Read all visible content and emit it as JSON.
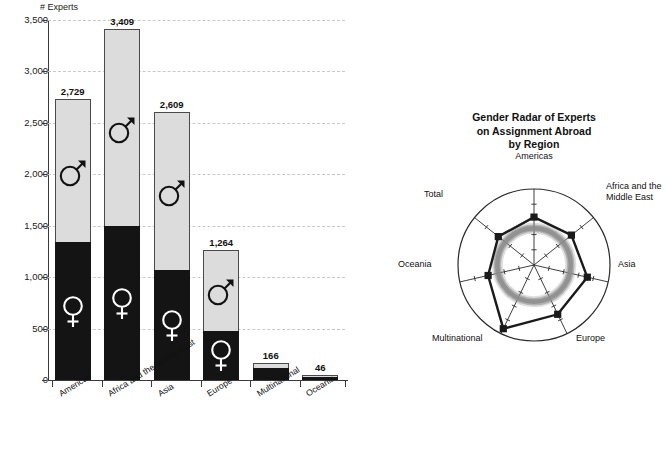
{
  "chart_data": [
    {
      "type": "bar",
      "subtype": "stacked-bar",
      "title": "",
      "xlabel": "",
      "ylabel": "# Experts",
      "ylim": [
        0,
        3500
      ],
      "ytick_labels": [
        "0",
        "500",
        "1,000",
        "1,500",
        "2,000",
        "2,500",
        "3,000",
        "3,500"
      ],
      "ytick_values": [
        0,
        500,
        1000,
        1500,
        2000,
        2500,
        3000,
        3500
      ],
      "grid": true,
      "legend": "none",
      "categories": [
        "Americas",
        "Africa and the Middle East",
        "Asia",
        "Europe",
        "Multinational",
        "Oceania"
      ],
      "totals": [
        2729,
        3409,
        2609,
        1264,
        166,
        46
      ],
      "total_labels": [
        "2,729",
        "3,409",
        "2,609",
        "1,264",
        "166",
        "46"
      ],
      "series": [
        {
          "name": "Female",
          "symbol": "venus-symbol",
          "color": "#141414",
          "values": [
            1340,
            1500,
            1070,
            480,
            112,
            33
          ]
        },
        {
          "name": "Male",
          "symbol": "mars-symbol",
          "color": "#dcdcdc",
          "values": [
            1389,
            1909,
            1539,
            784,
            54,
            13
          ]
        }
      ]
    },
    {
      "type": "radar",
      "title": "Gender Radar of Experts on Assignment Abroad by Region",
      "title_lines": [
        "Gender Radar of Experts",
        "on Assignment Abroad",
        "by Region"
      ],
      "axes": [
        "Americas",
        "Africa and the Middle East",
        "Asia",
        "Europe",
        "Multinational",
        "Oceania",
        "Total"
      ],
      "axis_labels": [
        "Americas",
        "Africa and the\nMiddle East",
        "Asia",
        "Europe",
        "Multinational",
        "Oceania",
        "Total"
      ],
      "rlim": [
        0,
        1
      ],
      "series": [
        {
          "name": "Share of region",
          "color": "#1a1a1a",
          "values": [
            0.63,
            0.63,
            0.72,
            0.72,
            0.93,
            0.62,
            0.6
          ]
        },
        {
          "name": "Reference circle",
          "color": "#8c8c8c",
          "values": [
            0.62,
            0.62,
            0.62,
            0.62,
            0.62,
            0.62,
            0.62
          ]
        }
      ],
      "gridline_count": 4,
      "outer_ring": true
    }
  ],
  "bar_chart": {
    "y_axis_title": "# Experts",
    "y_ticks": [
      {
        "label": "3,500",
        "value": 3500
      },
      {
        "label": "3,000",
        "value": 3000
      },
      {
        "label": "2,500",
        "value": 2500
      },
      {
        "label": "2,000",
        "value": 2000
      },
      {
        "label": "1,500",
        "value": 1500
      },
      {
        "label": "1,000",
        "value": 1000
      },
      {
        "label": "500",
        "value": 500
      },
      {
        "label": "0",
        "value": 0
      }
    ],
    "bars": [
      {
        "category": "Americas",
        "total_label": "2,729",
        "total": 2729,
        "female": 1340,
        "male": 1389,
        "show_glyphs": true
      },
      {
        "category": "Africa and the Middle East",
        "total_label": "3,409",
        "total": 3409,
        "female": 1500,
        "male": 1909,
        "show_glyphs": true
      },
      {
        "category": "Asia",
        "total_label": "2,609",
        "total": 2609,
        "female": 1070,
        "male": 1539,
        "show_glyphs": true
      },
      {
        "category": "Europe",
        "total_label": "1,264",
        "total": 1264,
        "female": 480,
        "male": 784,
        "show_glyphs": true
      },
      {
        "category": "Multinational",
        "total_label": "166",
        "total": 166,
        "female": 112,
        "male": 54,
        "show_glyphs": false
      },
      {
        "category": "Oceania",
        "total_label": "46",
        "total": 46,
        "female": 33,
        "male": 13,
        "show_glyphs": false
      }
    ],
    "colors": {
      "female_fill": "#141414",
      "male_fill": "#dcdcdc",
      "outline": "#4a4a4a",
      "grid": "#c9c9c9",
      "axis": "#3a3a3a"
    }
  },
  "radar_chart": {
    "title_lines": [
      "Gender Radar of Experts",
      "on Assignment Abroad",
      "by Region"
    ],
    "axes": [
      {
        "label": "Americas",
        "value": 0.63
      },
      {
        "label": "Africa and the Middle East",
        "value": 0.63
      },
      {
        "label": "Asia",
        "value": 0.72
      },
      {
        "label": "Europe",
        "value": 0.72
      },
      {
        "label": "Multinational",
        "value": 0.93
      },
      {
        "label": "Oceania",
        "value": 0.62
      },
      {
        "label": "Total",
        "value": 0.6
      }
    ],
    "label_africa_line1": "Africa and the",
    "label_africa_line2": "Middle East",
    "reference_ring_value": 0.62,
    "colors": {
      "data_line": "#1a1a1a",
      "reference_ring": "#8c8c8c",
      "axis": "#2a2a2a",
      "outer": "#2a2a2a"
    }
  }
}
